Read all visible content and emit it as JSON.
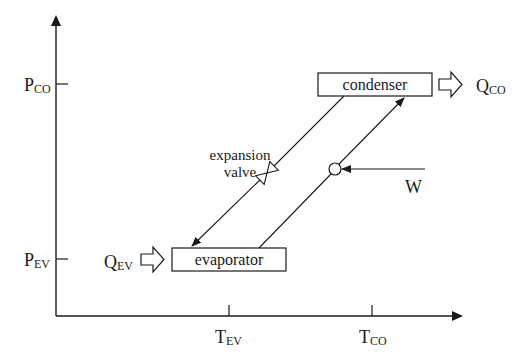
{
  "diagram": {
    "type": "refrigeration-cycle-pressure-temperature",
    "axes": {
      "y": {
        "ticks": [
          {
            "main": "P",
            "sub": "CO"
          },
          {
            "main": "P",
            "sub": "EV"
          }
        ]
      },
      "x": {
        "ticks": [
          {
            "main": "T",
            "sub": "EV"
          },
          {
            "main": "T",
            "sub": "CO"
          }
        ]
      }
    },
    "components": {
      "condenser": {
        "label": "condenser"
      },
      "evaporator": {
        "label": "evaporator"
      },
      "expansion_valve": {
        "label_line1": "expansion",
        "label_line2": "valve"
      },
      "compressor": {
        "work_label": "W"
      }
    },
    "heat_flows": {
      "condenser_out": {
        "main": "Q",
        "sub": "CO"
      },
      "evaporator_in": {
        "main": "Q",
        "sub": "EV"
      }
    },
    "colors": {
      "line": "#1a1a1a",
      "background": "#ffffff"
    }
  }
}
